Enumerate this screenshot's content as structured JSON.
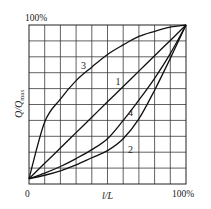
{
  "chart_data": {
    "type": "line",
    "title": "",
    "xlabel": "l/L",
    "ylabel": "Q/Qmax",
    "ylabel_main": "Q/Q",
    "ylabel_sub": "max",
    "xlim": [
      0,
      100
    ],
    "ylim": [
      0,
      100
    ],
    "grid": true,
    "grid_divisions": 10,
    "tick_labels": {
      "origin": "0",
      "x_max": "100%",
      "y_max": "100%"
    },
    "legend": "none (curves labeled inline)",
    "x": [
      0,
      10,
      20,
      30,
      40,
      50,
      60,
      70,
      80,
      90,
      100
    ],
    "series": [
      {
        "name": "1",
        "label": "1",
        "values": [
          3.3,
          13,
          22.6,
          32.3,
          42,
          51.7,
          61.3,
          71,
          80.7,
          90.3,
          100
        ],
        "label_pos": [
          57,
          35
        ]
      },
      {
        "name": "2",
        "label": "2",
        "values": [
          3.3,
          5.5,
          8.3,
          12,
          16.5,
          21,
          28.5,
          41,
          59,
          79,
          100
        ],
        "label_pos": [
          65,
          78
        ]
      },
      {
        "name": "3",
        "label": "3",
        "values": [
          3.3,
          39,
          53.4,
          65,
          73.5,
          81.5,
          87.5,
          92.8,
          96,
          98.7,
          100
        ],
        "label_pos": [
          35,
          25
        ]
      },
      {
        "name": "4",
        "label": "4",
        "values": [
          3.3,
          6.8,
          11,
          16,
          21.6,
          28.5,
          40,
          52.8,
          66.5,
          82,
          100
        ],
        "label_pos": [
          65,
          55
        ]
      }
    ]
  },
  "plot_box": {
    "left": 29,
    "top": 25,
    "right": 186,
    "bottom": 184
  }
}
